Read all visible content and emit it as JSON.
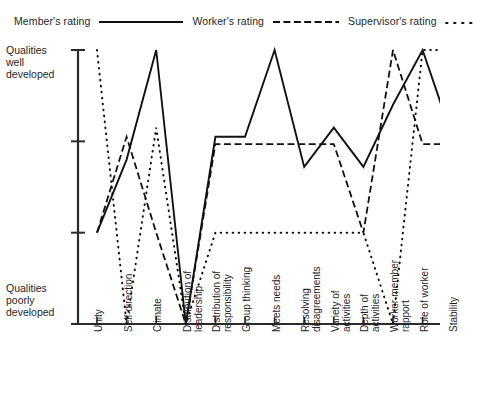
{
  "legend": {
    "entries": [
      {
        "label": "Member's rating",
        "style": "solid"
      },
      {
        "label": "Worker's rating",
        "style": "dashed"
      },
      {
        "label": "Supervisor's rating",
        "style": "dotted"
      }
    ]
  },
  "axis": {
    "y_top_label": "Qualities well developed",
    "y_bottom_label": "Qualities poorly developed",
    "y_top_label_lines": [
      "Qualities",
      "well",
      "developed"
    ],
    "y_bottom_label_lines": [
      "Qualities",
      "poorly",
      "developed"
    ]
  },
  "chart_data": {
    "type": "line",
    "title": "",
    "xlabel": "",
    "ylabel": "",
    "grid": false,
    "legend_position": "top",
    "ylim": [
      0,
      4
    ],
    "ytick_values": [
      0,
      1,
      2,
      3
    ],
    "ytick_labels": [
      "Qualities poorly developed",
      "",
      "",
      "Qualities well developed"
    ],
    "categories": [
      "Unity",
      "Self-direction",
      "Climate",
      "Distribution of leadership",
      "Distribution of responsibility",
      "Group thinking",
      "Meets needs",
      "Resolving disagreements",
      "Variety of activities",
      "Depth of activities",
      "Worker-member rapport",
      "Role of worker",
      "Stability"
    ],
    "category_lines": [
      [
        "Unity"
      ],
      [
        "Self-direction"
      ],
      [
        "Climate"
      ],
      [
        "Distribution of",
        "leadership"
      ],
      [
        "Distribution of",
        "responsibility"
      ],
      [
        "Group thinking"
      ],
      [
        "Meets needs"
      ],
      [
        "Resolving",
        "disagreements"
      ],
      [
        "Variety of",
        "activities"
      ],
      [
        "Depth of",
        "activities"
      ],
      [
        "Worker-member",
        "rapport"
      ],
      [
        "Role of worker"
      ],
      [
        "Stability"
      ]
    ],
    "series": [
      {
        "name": "Member's rating",
        "style": "solid",
        "values": [
          1.0,
          1.8,
          3.0,
          0.0,
          2.05,
          2.05,
          3.0,
          1.72,
          2.15,
          1.72,
          2.4,
          3.0,
          2.05
        ]
      },
      {
        "name": "Worker's rating",
        "style": "dashed",
        "values": [
          1.0,
          2.05,
          1.0,
          0.0,
          1.97,
          1.97,
          1.97,
          1.97,
          1.97,
          1.0,
          3.0,
          1.97,
          1.97
        ]
      },
      {
        "name": "Supervisor's rating",
        "style": "dotted",
        "values": [
          3.0,
          0.0,
          2.15,
          0.0,
          1.0,
          1.0,
          1.0,
          1.0,
          1.0,
          1.0,
          0.0,
          3.0,
          3.0
        ]
      }
    ]
  }
}
